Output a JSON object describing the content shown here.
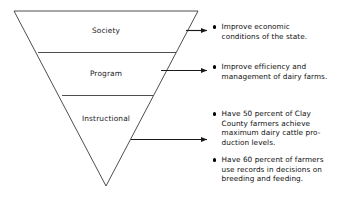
{
  "figure": {
    "stroke_color": "#3a3a3a",
    "text_color": "#111111"
  },
  "triangle": {
    "tiers": [
      {
        "id": "society",
        "label": "Society"
      },
      {
        "id": "program",
        "label": "Program"
      },
      {
        "id": "instructional",
        "label": "Instructional"
      }
    ]
  },
  "arrows": [
    {
      "id": "arrow-society",
      "target": "society"
    },
    {
      "id": "arrow-program",
      "target": "program"
    },
    {
      "id": "arrow-instructional",
      "target": "instructional"
    }
  ],
  "objectives": [
    {
      "id": "objective-society",
      "tier": "Society",
      "text": "Improve economic\nconditions of the state."
    },
    {
      "id": "objective-program",
      "tier": "Program",
      "text": "Improve efficiency and\nmanagement of dairy farms."
    },
    {
      "id": "objective-instructional-1",
      "tier": "Instructional",
      "text": "Have 50 percent of Clay\nCounty farmers achieve\nmaximum dairy cattle pro-\nduction levels."
    },
    {
      "id": "objective-instructional-2",
      "tier": "Instructional",
      "text": "Have 60 percent of farmers\nuse records in decisions on\nbreeding and feeding."
    }
  ]
}
